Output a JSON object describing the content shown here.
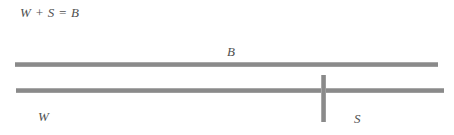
{
  "figure": {
    "equation": "W + S = B",
    "background_color": "#ffffff",
    "line_color": "#8a8a8a",
    "text_color": "#4f4f4f"
  },
  "labels": {
    "total": "B",
    "first_segment": "W",
    "second_segment": "S"
  },
  "bars": {
    "top": {
      "name": "B",
      "label": "B",
      "x_start": 15,
      "x_end": 438,
      "y": 62,
      "thickness": 5
    },
    "bottom": {
      "name": "W + S",
      "x_start": 16,
      "x_end": 444,
      "y": 88,
      "thickness": 5,
      "divider_x": 323,
      "segments": [
        {
          "label": "W",
          "x_start": 16,
          "x_end": 323
        },
        {
          "label": "S",
          "x_start": 323,
          "x_end": 444
        }
      ]
    }
  }
}
